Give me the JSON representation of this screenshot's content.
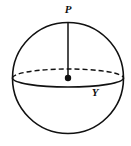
{
  "figure": {
    "name": "sphere-with-radius-diagram",
    "background_color": "#ffffff",
    "stroke_color": "#111111",
    "canvas": {
      "width": 131,
      "height": 146
    },
    "sphere": {
      "center": {
        "x": 68,
        "y": 78
      },
      "radius": 55.5,
      "outline_color": "#111111",
      "outline_width": 1.6,
      "fill": "none"
    },
    "equator": {
      "name": "equator-ellipse",
      "center": {
        "x": 68,
        "y": 78
      },
      "rx": 55.5,
      "ry": 9,
      "back_half_style": "dashed",
      "front_half_style": "solid",
      "dash_pattern": "5,3",
      "stroke_color": "#111111",
      "stroke_width": 1.4
    },
    "radius_segment": {
      "name": "radius-line-p-to-center",
      "from": {
        "x": 68,
        "y": 22
      },
      "to": {
        "x": 68,
        "y": 78
      },
      "stroke_color": "#111111",
      "stroke_width": 1.5
    },
    "center_point": {
      "name": "center-dot",
      "x": 68,
      "y": 78,
      "radius": 3.2,
      "fill": "#111111"
    },
    "labels": [
      {
        "id": "label-p",
        "text": "P",
        "x": 68,
        "y": 10
      },
      {
        "id": "label-y",
        "text": "Y",
        "x": 95,
        "y": 93
      }
    ]
  }
}
